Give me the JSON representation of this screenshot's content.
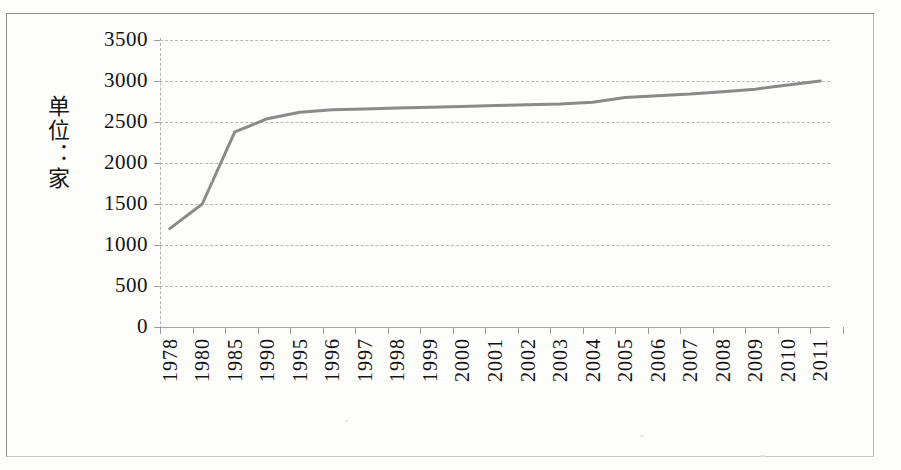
{
  "figure": {
    "background_color": "#fdfdfc",
    "frame_color": "#9c9c9c",
    "y_axis_title": "单位：家"
  },
  "chart_data": {
    "type": "line",
    "title": "",
    "subtitle": "",
    "xlabel": "",
    "ylabel": "单位：家",
    "ylim": [
      0,
      3500
    ],
    "ytick_step": 500,
    "ytick_labels": [
      "0",
      "500",
      "1000",
      "1500",
      "2000",
      "2500",
      "3000",
      "3500"
    ],
    "ytick_values": [
      0,
      500,
      1000,
      1500,
      2000,
      2500,
      3000,
      3500
    ],
    "grid": true,
    "grid_style": "dashed-horizontal",
    "legend": "none",
    "line_color": "#8a8a8a",
    "line_width": 3,
    "markers": false,
    "categories": [
      "1978",
      "1980",
      "1985",
      "1990",
      "1995",
      "1996",
      "1997",
      "1998",
      "1999",
      "2000",
      "2001",
      "2002",
      "2003",
      "2004",
      "2005",
      "2006",
      "2007",
      "2008",
      "2009",
      "2010",
      "2011"
    ],
    "values": [
      1200,
      1500,
      2380,
      2540,
      2620,
      2650,
      2660,
      2670,
      2680,
      2690,
      2700,
      2710,
      2720,
      2740,
      2800,
      2820,
      2840,
      2870,
      2900,
      2950,
      3000
    ],
    "series": [
      {
        "name": "",
        "values": [
          1200,
          1500,
          2380,
          2540,
          2620,
          2650,
          2660,
          2670,
          2680,
          2690,
          2700,
          2710,
          2720,
          2740,
          2800,
          2820,
          2840,
          2870,
          2900,
          2950,
          3000
        ]
      }
    ]
  }
}
